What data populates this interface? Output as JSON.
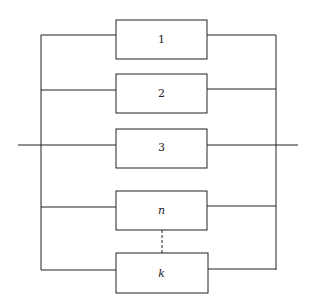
{
  "diagram": {
    "type": "parallel-system-block-diagram",
    "blocks": [
      {
        "id": "1",
        "label": "1",
        "italic": false
      },
      {
        "id": "2",
        "label": "2",
        "italic": false
      },
      {
        "id": "3",
        "label": "3",
        "italic": false
      },
      {
        "id": "n",
        "label": "n",
        "italic": true
      },
      {
        "id": "k",
        "label": "k",
        "italic": true
      }
    ],
    "connector_between": [
      "n",
      "k"
    ],
    "connector_style": "dashed",
    "line_color": "#222222"
  }
}
